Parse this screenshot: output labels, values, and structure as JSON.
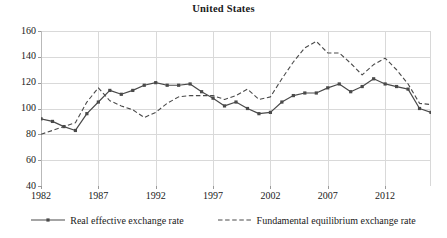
{
  "chart_data": {
    "type": "line",
    "title": "United States",
    "xlabel": "",
    "ylabel": "",
    "xlim": [
      1982,
      2016
    ],
    "ylim": [
      40,
      160
    ],
    "ytick_labels": [
      "160",
      "140",
      "120",
      "100",
      "80",
      "60",
      "40"
    ],
    "ytick_values": [
      160,
      140,
      120,
      100,
      80,
      60,
      40
    ],
    "xtick_labels": [
      "1982",
      "1987",
      "1992",
      "1997",
      "2002",
      "2007",
      "2012"
    ],
    "xtick_values": [
      1982,
      1987,
      1992,
      1997,
      2002,
      2007,
      2012
    ],
    "grid": true,
    "legend_position": "bottom",
    "x": [
      1982,
      1983,
      1984,
      1985,
      1986,
      1987,
      1988,
      1989,
      1990,
      1991,
      1992,
      1993,
      1994,
      1995,
      1996,
      1997,
      1998,
      1999,
      2000,
      2001,
      2002,
      2003,
      2004,
      2005,
      2006,
      2007,
      2008,
      2009,
      2010,
      2011,
      2012,
      2013,
      2014,
      2015,
      2016
    ],
    "series": [
      {
        "name": "Real effective exchange rate",
        "style": "solid",
        "marker": "square",
        "color": "#4a4a4a",
        "values": [
          92,
          90,
          86,
          83,
          96,
          105,
          114,
          111,
          114,
          118,
          120,
          118,
          118,
          119,
          113,
          108,
          102,
          105,
          100,
          96,
          97,
          105,
          110,
          112,
          112,
          116,
          119,
          113,
          117,
          123,
          119,
          117,
          115,
          100,
          97
        ]
      },
      {
        "name": "Fundamental equilibrium exchange rate",
        "style": "dashed",
        "marker": "none",
        "color": "#4a4a4a",
        "values": [
          80,
          83,
          86,
          89,
          105,
          116,
          106,
          102,
          99,
          93,
          97,
          104,
          109,
          110,
          110,
          110,
          107,
          110,
          115,
          107,
          109,
          123,
          136,
          147,
          152,
          143,
          143,
          135,
          126,
          134,
          139,
          130,
          119,
          104,
          103
        ]
      }
    ]
  },
  "legend": {
    "items": [
      {
        "label": "Real effective exchange rate",
        "style": "solid"
      },
      {
        "label": "Fundamental equilibrium exchange rate",
        "style": "dashed"
      }
    ]
  }
}
